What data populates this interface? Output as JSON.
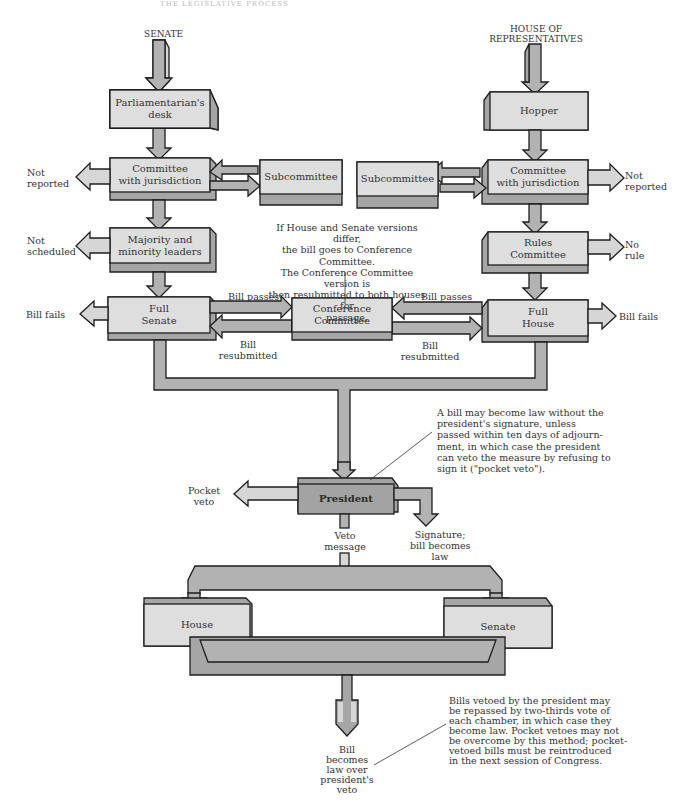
{
  "header": {
    "running_title": "THE LEGISLATIVE PROCESS"
  },
  "entry_points": {
    "senate": "SENATE",
    "house_line1": "HOUSE OF",
    "house_line2": "REPRESENTATIVES"
  },
  "senate_side": {
    "parliamentarian": [
      "Parliamentarian's",
      "desk"
    ],
    "committee": [
      "Committee",
      "with jurisdiction"
    ],
    "subcommittee": "Subcommittee",
    "leaders": [
      "Majority and",
      "minority leaders"
    ],
    "full": [
      "Full",
      "Senate"
    ],
    "exits": {
      "not_reported": [
        "Not",
        "reported"
      ],
      "not_scheduled": [
        "Not",
        "scheduled"
      ],
      "bill_fails": "Bill fails"
    }
  },
  "house_side": {
    "hopper": "Hopper",
    "committee": [
      "Committee",
      "with jurisdiction"
    ],
    "subcommittee": "Subcommittee",
    "rules": [
      "Rules",
      "Committee"
    ],
    "full": [
      "Full",
      "House"
    ],
    "exits": {
      "not_reported": [
        "Not",
        "reported"
      ],
      "no_rule": [
        "No",
        "rule"
      ],
      "bill_fails": "Bill fails"
    }
  },
  "conference": {
    "box": [
      "Conference",
      "Committee"
    ],
    "note": [
      "If House and Senate versions differ,",
      "the bill goes to Conference Committee.",
      "The Conference Committee version is",
      "then resubmitted to both houses for",
      "passage."
    ],
    "bill_passes": "Bill passes",
    "bill_resubmitted": [
      "Bill",
      "resubmitted"
    ]
  },
  "president": {
    "box": "President",
    "pocket_veto": [
      "Pocket",
      "veto"
    ],
    "signature": [
      "Signature;",
      "bill becomes",
      "law"
    ],
    "veto_message": [
      "Veto",
      "message"
    ],
    "note": [
      "A bill may become law without the",
      "president's signature, unless",
      "passed within ten days of adjourn-",
      "ment, in which case the president",
      "can veto the measure by refusing to",
      "sign it (\"pocket veto\")."
    ]
  },
  "override": {
    "house": "House",
    "senate": "Senate",
    "result": [
      "Bill",
      "becomes",
      "law over",
      "president's",
      "veto"
    ],
    "note": [
      "Bills vetoed by the president may",
      "be repassed by two-thirds vote of",
      "each chamber, in which case they",
      "become law. Pocket vetoes may not",
      "be overcome by this method; pocket-",
      "vetoed bills must be reintroduced",
      "in the next session of Congress."
    ]
  },
  "colors": {
    "box_light": "#dcdcdc",
    "box_side": "#a9a9a9",
    "box_dark": "#9e9e9e",
    "arrow": "#b5b5b5",
    "arrow_light": "#d4d4d4",
    "outline": "#1e1e1e"
  }
}
